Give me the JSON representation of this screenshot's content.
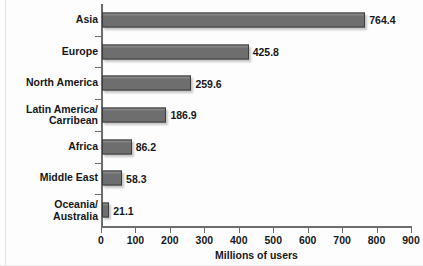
{
  "chart_data": {
    "type": "bar",
    "orientation": "horizontal",
    "title": "",
    "xlabel": "Millions of users",
    "ylabel": "",
    "categories": [
      "Asia",
      "Europe",
      "North America",
      "Latin America/\nCarribean",
      "Africa",
      "Middle East",
      "Oceania/\nAustralia"
    ],
    "values": [
      764.4,
      425.8,
      259.6,
      186.9,
      86.2,
      58.3,
      21.1
    ],
    "value_labels": [
      "764.4",
      "425.8",
      "259.6",
      "186.9",
      "86.2",
      "58.3",
      "21.1"
    ],
    "xlim": [
      0,
      900
    ],
    "xticks": [
      0,
      100,
      200,
      300,
      400,
      500,
      600,
      700,
      800,
      900
    ],
    "xtick_labels": [
      "0",
      "100",
      "200",
      "300",
      "400",
      "500",
      "600",
      "700",
      "800",
      "900"
    ],
    "grid": false,
    "legend": null,
    "bar_color": "#6e6e6e",
    "bar_border_color": "#3c3c3c",
    "axis_color": "#6d6d6d",
    "text_color": "#17171a",
    "background": "#fdfdfd"
  }
}
